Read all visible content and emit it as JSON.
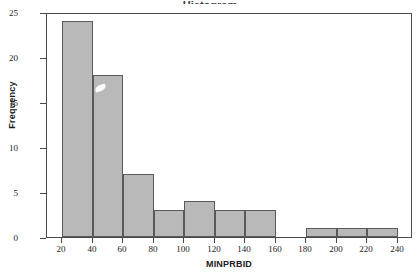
{
  "figure": {
    "partial_title": "Histogram",
    "background_color": "#ffffff"
  },
  "chart_data": {
    "type": "bar",
    "title": "",
    "xlabel": "MINPRBID",
    "ylabel": "Frequency",
    "xlim": [
      10,
      250
    ],
    "ylim": [
      0,
      25
    ],
    "xticks": [
      20,
      40,
      60,
      80,
      100,
      120,
      140,
      160,
      180,
      200,
      220,
      240
    ],
    "yticks": [
      0,
      5,
      10,
      15,
      20,
      25
    ],
    "grid": false,
    "legend": null,
    "bin_width": 20,
    "bin_edges": [
      20,
      40,
      60,
      80,
      100,
      120,
      140,
      160,
      180,
      200,
      220,
      240
    ],
    "categories": [
      "20-40",
      "40-60",
      "60-80",
      "80-100",
      "100-120",
      "120-140",
      "140-160",
      "160-180",
      "180-200",
      "200-220",
      "220-240"
    ],
    "values": [
      24,
      18,
      7,
      3,
      4,
      3,
      3,
      0,
      1,
      1,
      1
    ],
    "bar_fill_color": "#b9b9b9",
    "bar_edge_color": "#5a5a5a",
    "total_count": 65,
    "annotations": [
      {
        "name": "scratch-artifact",
        "x_value": 45,
        "y_value": 16.2
      }
    ]
  }
}
